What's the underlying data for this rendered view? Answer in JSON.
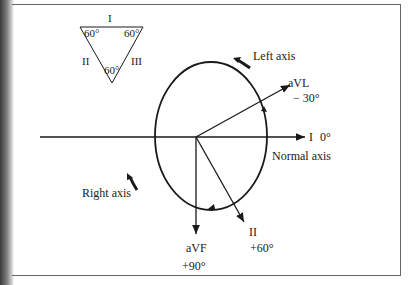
{
  "triangle": {
    "lead_top": "I",
    "lead_left": "II",
    "lead_right": "III",
    "angle_top_left": "60°",
    "angle_top_right": "60°",
    "angle_bottom": "60°"
  },
  "axes": {
    "lead_I": {
      "name": "I",
      "angle": "0°"
    },
    "lead_aVL": {
      "name": "aVL",
      "angle": "− 30°"
    },
    "lead_II": {
      "name": "II",
      "angle": "+60°"
    },
    "lead_aVF": {
      "name": "aVF",
      "angle": "+90°"
    }
  },
  "regions": {
    "left_axis": "Left axis",
    "normal_axis": "Normal axis",
    "right_axis": "Right axis"
  },
  "colors": {
    "ink": "#1a1a1a",
    "frame": "#666666"
  }
}
